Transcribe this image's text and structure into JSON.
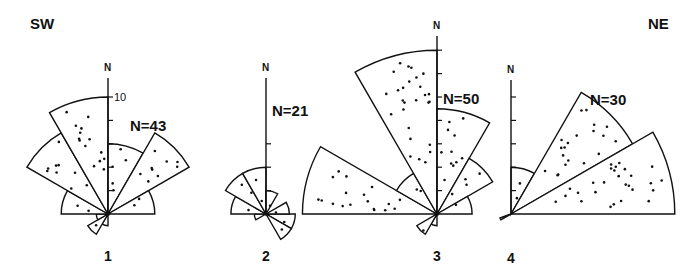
{
  "labels": {
    "left_side": "SW",
    "right_side": "NE"
  },
  "chart_data": [
    {
      "type": "rose",
      "id": "1",
      "label": "1",
      "n_label": "N=43",
      "north_label": "N",
      "scale_label": "10",
      "scale_value": 10,
      "sector_width_deg": 30,
      "sectors": [
        {
          "from": 180,
          "to": 210,
          "value": 1
        },
        {
          "from": 210,
          "to": 240,
          "value": 2
        },
        {
          "from": 240,
          "to": 270,
          "value": 1
        },
        {
          "from": 270,
          "to": 300,
          "value": 4
        },
        {
          "from": 300,
          "to": 330,
          "value": 8
        },
        {
          "from": 330,
          "to": 360,
          "value": 10
        },
        {
          "from": 0,
          "to": 30,
          "value": 6
        },
        {
          "from": 30,
          "to": 60,
          "value": 8
        },
        {
          "from": 60,
          "to": 90,
          "value": 4
        }
      ]
    },
    {
      "type": "rose",
      "id": "2",
      "label": "2",
      "n_label": "N=21",
      "north_label": "N",
      "sector_width_deg": 30,
      "sectors": [
        {
          "from": 240,
          "to": 270,
          "value": 1
        },
        {
          "from": 270,
          "to": 300,
          "value": 3
        },
        {
          "from": 300,
          "to": 330,
          "value": 4
        },
        {
          "from": 330,
          "to": 360,
          "value": 4
        },
        {
          "from": 0,
          "to": 30,
          "value": 2
        },
        {
          "from": 90,
          "to": 120,
          "value": 2.5
        },
        {
          "from": 120,
          "to": 150,
          "value": 2.5
        },
        {
          "from": 60,
          "to": 90,
          "value": 2
        }
      ]
    },
    {
      "type": "rose",
      "id": "3",
      "label": "3",
      "n_label": "N=50",
      "north_label": "N",
      "sector_width_deg": 30,
      "sectors": [
        {
          "from": 180,
          "to": 210,
          "value": 1
        },
        {
          "from": 210,
          "to": 240,
          "value": 2
        },
        {
          "from": 270,
          "to": 300,
          "value": 11.5
        },
        {
          "from": 300,
          "to": 330,
          "value": 4
        },
        {
          "from": 330,
          "to": 360,
          "value": 14
        },
        {
          "from": 0,
          "to": 30,
          "value": 9
        },
        {
          "from": 30,
          "to": 60,
          "value": 5.5
        },
        {
          "from": 60,
          "to": 90,
          "value": 3
        }
      ]
    },
    {
      "type": "rose",
      "id": "4",
      "label": "4",
      "n_label": "N=30",
      "north_label": "N",
      "sector_width_deg": 30,
      "sectors": [
        {
          "from": 240,
          "to": 250,
          "value": 1
        },
        {
          "from": 0,
          "to": 30,
          "value": 4
        },
        {
          "from": 30,
          "to": 60,
          "value": 12
        },
        {
          "from": 60,
          "to": 90,
          "value": 14
        }
      ]
    }
  ],
  "layout": {
    "px_per_unit": 11.7,
    "tick_every": 2,
    "diagrams": [
      {
        "cx": 108,
        "cy": 214,
        "axis_top": 78,
        "ticks": [
          2,
          4,
          6,
          8,
          10
        ],
        "n_label_x": 130,
        "n_label_y": 117,
        "north_y": 62,
        "label_y": 246
      },
      {
        "cx": 266,
        "cy": 214,
        "axis_top": 78,
        "ticks": [
          2,
          4,
          6
        ],
        "n_label_x": 272,
        "n_label_y": 102,
        "north_y": 62,
        "label_y": 246
      },
      {
        "cx": 437,
        "cy": 214,
        "axis_top": 36,
        "ticks": [
          2,
          4,
          6,
          8,
          10,
          12,
          14
        ],
        "n_label_x": 443,
        "n_label_y": 90,
        "north_y": 19,
        "label_y": 246
      },
      {
        "cx": 511,
        "cy": 214,
        "axis_top": 80,
        "ticks": [
          2,
          4,
          6,
          8,
          10
        ],
        "n_label_x": 590,
        "n_label_y": 91,
        "north_y": 64,
        "label_y": 248
      }
    ]
  }
}
